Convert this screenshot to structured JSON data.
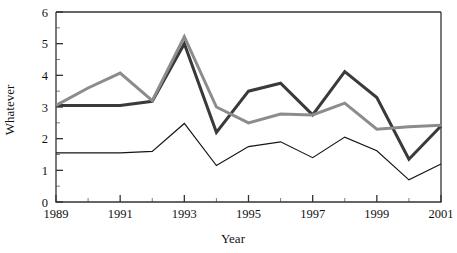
{
  "chart_data": {
    "type": "line",
    "title": "",
    "xlabel": "Year",
    "ylabel": "Whatever",
    "x": [
      1989,
      1990,
      1991,
      1992,
      1993,
      1994,
      1995,
      1996,
      1997,
      1998,
      1999,
      2000,
      2001
    ],
    "xlim": [
      1989,
      2001
    ],
    "ylim": [
      0,
      6
    ],
    "grid": false,
    "legend": "none",
    "x_tick_labels": [
      "1989",
      "1991",
      "1993",
      "1995",
      "1997",
      "1999",
      "2001"
    ],
    "x_tick_values": [
      1989,
      1991,
      1993,
      1995,
      1997,
      1999,
      2001
    ],
    "x_minor_ticks": [
      1990,
      1992,
      1994,
      1996,
      1998,
      2000
    ],
    "y_tick_labels": [
      "0",
      "1",
      "2",
      "3",
      "4",
      "5",
      "6"
    ],
    "y_tick_values": [
      0,
      1,
      2,
      3,
      4,
      5,
      6
    ],
    "y_minor_ticks": [
      0.5,
      1.5,
      2.5,
      3.5,
      4.5,
      5.5
    ],
    "series": [
      {
        "name": "dark-series",
        "color": "#3a3a3a",
        "width": 3.0,
        "values": [
          3.05,
          3.05,
          3.05,
          3.18,
          5.0,
          2.2,
          3.5,
          3.75,
          2.75,
          4.12,
          3.3,
          1.35,
          2.4
        ]
      },
      {
        "name": "gray-series",
        "color": "#8c8c8c",
        "width": 3.0,
        "values": [
          3.05,
          3.6,
          4.07,
          3.2,
          5.22,
          3.0,
          2.5,
          2.78,
          2.75,
          3.12,
          2.3,
          2.38,
          2.42
        ]
      },
      {
        "name": "thin-black-series",
        "color": "#151515",
        "width": 1.2,
        "values": [
          1.55,
          1.55,
          1.55,
          1.6,
          2.48,
          1.15,
          1.75,
          1.9,
          1.4,
          2.05,
          1.62,
          0.7,
          1.2
        ]
      }
    ]
  },
  "axes": {
    "frame_color": "#333333",
    "background": "#ffffff"
  }
}
